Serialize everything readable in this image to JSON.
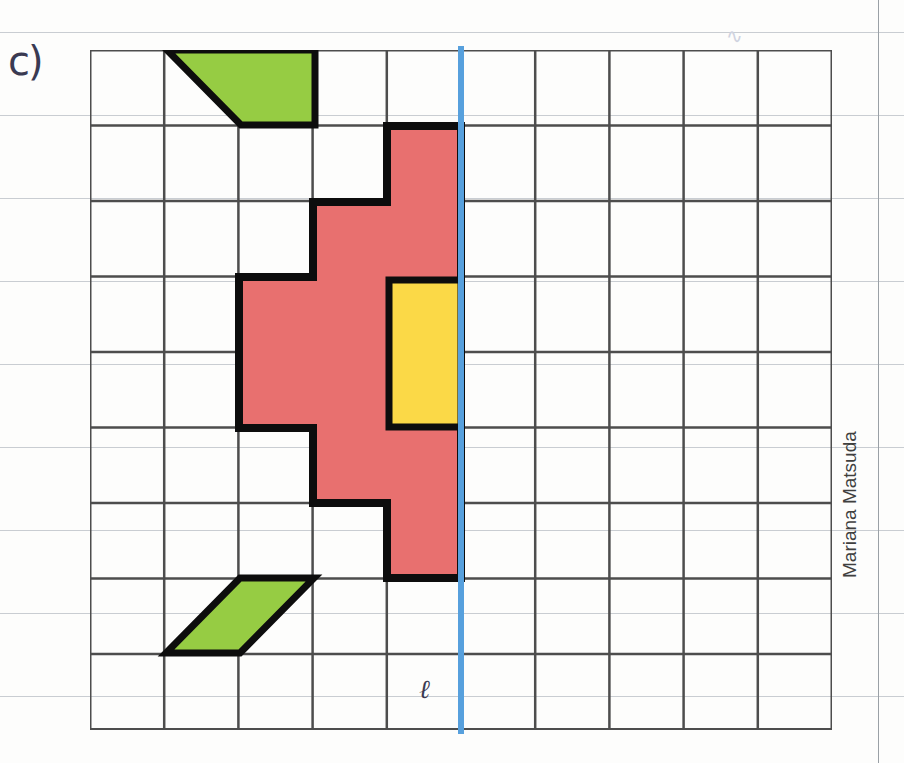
{
  "page": {
    "width": 904,
    "height": 763,
    "background_color": "#fdfdfc",
    "exercise_label": "c)",
    "symmetry_line_label": "ℓ",
    "author_credit": "Mariana Matsuda",
    "scribble": "∿"
  },
  "paper": {
    "ruled_line_color": "#c9cdd2",
    "ruled_line_ys": [
      32,
      115,
      198,
      281,
      364,
      447,
      530,
      613,
      696
    ],
    "margin_line_x": 878,
    "margin_line_color": "#9aa0a6"
  },
  "grid": {
    "origin_x": 90,
    "origin_y": 50,
    "cols": 10,
    "rows": 9,
    "cell_width": 74.2,
    "cell_height": 75.5,
    "line_color": "#4d4d4d",
    "line_width": 2.5,
    "outer_line_width": 3
  },
  "symmetry_line": {
    "name": "line-of-symmetry",
    "color": "#57a0dd",
    "x": 458,
    "top": 46,
    "height": 688,
    "thickness": 6,
    "grid_column_index": 5,
    "label": "ℓ"
  },
  "shapes": [
    {
      "id": "green-parallelogram-top",
      "type": "parallelogram",
      "fill": "#96cc43",
      "stroke": "#0d0d0d",
      "stroke_width": 7,
      "points_px": [
        [
          167,
          50
        ],
        [
          315,
          50
        ],
        [
          315,
          125
        ],
        [
          241,
          125
        ]
      ],
      "grid_cells": "row 1, columns 2-3"
    },
    {
      "id": "red-polygon",
      "type": "polygon",
      "fill": "#e8706f",
      "stroke": "#0d0d0d",
      "stroke_width": 8,
      "points_px": [
        [
          387,
          126
        ],
        [
          461,
          126
        ],
        [
          461,
          578
        ],
        [
          387,
          578
        ],
        [
          387,
          503
        ],
        [
          313,
          503
        ],
        [
          313,
          428
        ],
        [
          239,
          428
        ],
        [
          239,
          277
        ],
        [
          313,
          277
        ],
        [
          313,
          202
        ],
        [
          387,
          202
        ]
      ],
      "grid_cells": "stair-step polygon, rows 2-7"
    },
    {
      "id": "yellow-rectangle",
      "type": "rectangle",
      "fill": "#fbd947",
      "stroke": "#0d0d0d",
      "stroke_width": 7,
      "points_px": [
        [
          389,
          280
        ],
        [
          461,
          280
        ],
        [
          461,
          427
        ],
        [
          389,
          427
        ]
      ],
      "grid_cells": "rows 4-5, column 5"
    },
    {
      "id": "green-parallelogram-bottom",
      "type": "parallelogram",
      "fill": "#96cc43",
      "stroke": "#0d0d0d",
      "stroke_width": 7,
      "points_px": [
        [
          240,
          578
        ],
        [
          314,
          578
        ],
        [
          240,
          653
        ],
        [
          166,
          653
        ]
      ],
      "grid_cells": "row 8, columns 2-3"
    }
  ],
  "colors": {
    "green": "#96cc43",
    "red": "#e8706f",
    "yellow": "#fbd947",
    "blue": "#57a0dd",
    "outline": "#0d0d0d",
    "grid": "#4d4d4d",
    "ink": "#3a3a52"
  }
}
